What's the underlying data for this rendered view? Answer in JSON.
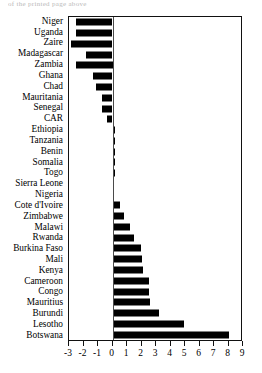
{
  "figure": {
    "top_crop_text": "of the printed page above",
    "bar_color": "#000000",
    "frame_color": "#111111",
    "background": "#ffffff"
  },
  "chart_data": {
    "type": "bar",
    "orientation": "horizontal",
    "title": "",
    "xlabel": "",
    "ylabel": "",
    "xlim": [
      -3,
      9
    ],
    "xticks": [
      -3,
      -2,
      -1,
      0,
      1,
      2,
      3,
      4,
      5,
      6,
      7,
      8,
      9
    ],
    "xticklabels": [
      "-3",
      "-2",
      "-1",
      "0",
      "1",
      "2",
      "3",
      "4",
      "5",
      "6",
      "7",
      "8",
      "9"
    ],
    "grid": false,
    "legend": false,
    "categories": [
      "Niger",
      "Uganda",
      "Zaire",
      "Madagascar",
      "Zambia",
      "Ghana",
      "Chad",
      "Mauritania",
      "Senegal",
      "CAR",
      "Ethiopia",
      "Tanzania",
      "Benin",
      "Somalia",
      "Togo",
      "Sierra Leone",
      "Nigeria",
      "Cote d'Ivoire",
      "Zimbabwe",
      "Malawi",
      "Rwanda",
      "Burkina Faso",
      "Mali",
      "Kenya",
      "Cameroon",
      "Congo",
      "Mauritius",
      "Burundi",
      "Lesotho",
      "Botswana"
    ],
    "values": [
      -2.55,
      -2.55,
      -2.85,
      -1.85,
      -2.5,
      -1.35,
      -1.15,
      -0.7,
      -0.7,
      -0.35,
      0.15,
      0.15,
      0.15,
      0.15,
      0.15,
      0.0,
      0.1,
      0.55,
      0.8,
      1.2,
      1.5,
      1.95,
      2.0,
      2.1,
      2.5,
      2.55,
      2.6,
      3.2,
      4.9,
      8.0
    ]
  }
}
